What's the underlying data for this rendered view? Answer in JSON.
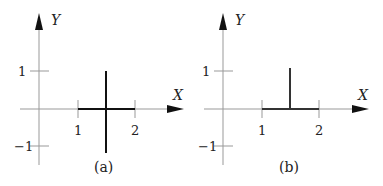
{
  "panels": [
    {
      "id": "a",
      "caption": "(a)",
      "x_axis_label": "X",
      "y_axis_label": "Y",
      "x_ticks": [
        "1",
        "2"
      ],
      "y_ticks": [
        "1",
        "−1"
      ],
      "shape": "cross: horizontal segment from x=1 to x=2 on the X axis, vertical segment at x=1.5 from y=-1 to y=1"
    },
    {
      "id": "b",
      "caption": "(b)",
      "x_axis_label": "X",
      "y_axis_label": "Y",
      "x_ticks": [
        "1",
        "2"
      ],
      "y_ticks": [
        "1",
        "−1"
      ],
      "shape": "inverted T: horizontal segment from x=1 to x=2 on the X axis, vertical segment at x=1.5 from y=0 to y=1"
    }
  ],
  "colors": {
    "axis": "#888888",
    "shape": "#111111",
    "text": "#222222"
  }
}
